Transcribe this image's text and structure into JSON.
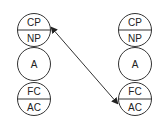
{
  "diagram": {
    "columns": [
      {
        "id": "left",
        "nodes": [
          {
            "type": "split",
            "top": "CP",
            "bottom": "NP"
          },
          {
            "type": "single",
            "label": "A"
          },
          {
            "type": "split",
            "top": "FC",
            "bottom": "AC"
          }
        ]
      },
      {
        "id": "right",
        "nodes": [
          {
            "type": "split",
            "top": "CP",
            "bottom": "NP"
          },
          {
            "type": "single",
            "label": "A"
          },
          {
            "type": "split",
            "top": "FC",
            "bottom": "AC"
          }
        ]
      }
    ],
    "edges": [
      {
        "from": "left.CP/NP",
        "to": "right.FC/AC",
        "style": "double-headed-arrow"
      }
    ],
    "colors": {
      "stroke": "#333333",
      "text": "#222222",
      "background": "#ffffff"
    }
  }
}
